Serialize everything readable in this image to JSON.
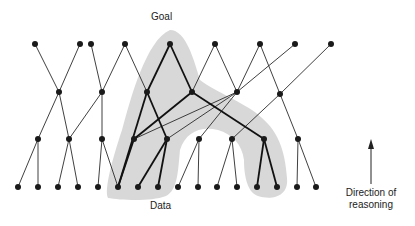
{
  "labels": {
    "goal": "Goal",
    "data": "Data",
    "direction_line1": "Direction of",
    "direction_line2": "reasoning"
  },
  "colors": {
    "node": "#1a1a1a",
    "edge": "#2a2a2a",
    "highlight_region": "#d4d4d4",
    "text": "#222222",
    "background": "#ffffff"
  },
  "diagram": {
    "type": "backward-chaining reasoning graph",
    "levels": {
      "top": [
        35,
        80,
        91,
        125,
        170,
        215,
        260,
        295,
        331
      ],
      "level2": [
        59,
        102,
        147,
        192,
        237,
        280
      ],
      "level3": [
        38,
        69,
        102,
        134,
        167,
        199,
        232,
        264,
        298
      ],
      "bottom": [
        18,
        38,
        58,
        78,
        98,
        118,
        138,
        158,
        178,
        198,
        217,
        237,
        257,
        277,
        297,
        316
      ]
    },
    "level_y": {
      "top": 44,
      "level2": 92,
      "level3": 139,
      "bottom": 187
    },
    "goal_node": "top.4",
    "highlighted_path_note": "Bold edges inside shaded region trace reasoning from Goal down to supporting Data",
    "arrow": {
      "x": 344,
      "y_from": 172,
      "y_to": 140,
      "meaning": "upward"
    }
  }
}
